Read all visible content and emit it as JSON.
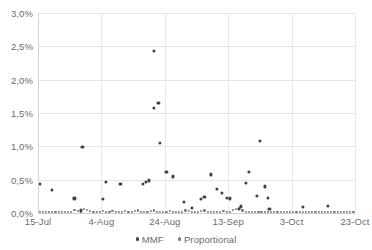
{
  "chart_data": {
    "type": "scatter",
    "title": "",
    "xlabel": "",
    "ylabel": "",
    "ylim": [
      0,
      3.0
    ],
    "ytick_labels": [
      "0,0%",
      "0,5%",
      "1,0%",
      "1,5%",
      "2,0%",
      "2,5%",
      "3,0%"
    ],
    "ytick_values": [
      0,
      0.5,
      1.0,
      1.5,
      2.0,
      2.5,
      3.0
    ],
    "xtick_labels": [
      "15-Jul",
      "4-Aug",
      "24-Aug",
      "13-Sep",
      "3-Oct",
      "23-Oct"
    ],
    "xtick_days": [
      0,
      20,
      40,
      60,
      80,
      100
    ],
    "xlim_days": [
      0,
      100
    ],
    "grid": "horizontal-and-vertical",
    "legend_position": "bottom-center",
    "unit": "percent",
    "decimal_separator": ",",
    "series": [
      {
        "name": "MMF",
        "color": "#404040",
        "marker": "circle",
        "points": [
          {
            "x": 0.5,
            "y": 0.44
          },
          {
            "x": 4.5,
            "y": 0.35
          },
          {
            "x": 11.5,
            "y": 0.22
          },
          {
            "x": 13.5,
            "y": 0.04
          },
          {
            "x": 14.0,
            "y": 0.99
          },
          {
            "x": 20.5,
            "y": 0.21
          },
          {
            "x": 21.5,
            "y": 0.47
          },
          {
            "x": 26.0,
            "y": 0.44
          },
          {
            "x": 33.0,
            "y": 0.44
          },
          {
            "x": 34.0,
            "y": 0.47
          },
          {
            "x": 35.0,
            "y": 0.49
          },
          {
            "x": 36.5,
            "y": 2.43
          },
          {
            "x": 36.5,
            "y": 1.58
          },
          {
            "x": 38.0,
            "y": 1.65
          },
          {
            "x": 38.5,
            "y": 1.05
          },
          {
            "x": 40.5,
            "y": 0.62
          },
          {
            "x": 42.5,
            "y": 0.55
          },
          {
            "x": 46.0,
            "y": 0.17
          },
          {
            "x": 48.5,
            "y": 0.08
          },
          {
            "x": 51.5,
            "y": 0.21
          },
          {
            "x": 52.5,
            "y": 0.24
          },
          {
            "x": 54.5,
            "y": 0.58
          },
          {
            "x": 56.5,
            "y": 0.36
          },
          {
            "x": 58.0,
            "y": 0.3
          },
          {
            "x": 59.5,
            "y": 0.23
          },
          {
            "x": 60.5,
            "y": 0.22
          },
          {
            "x": 63.5,
            "y": 0.06
          },
          {
            "x": 64.0,
            "y": 0.1
          },
          {
            "x": 65.5,
            "y": 0.45
          },
          {
            "x": 66.5,
            "y": 0.62
          },
          {
            "x": 69.0,
            "y": 0.26
          },
          {
            "x": 70.0,
            "y": 1.08
          },
          {
            "x": 71.5,
            "y": 0.4
          },
          {
            "x": 72.5,
            "y": 0.23
          },
          {
            "x": 73.0,
            "y": 0.06
          },
          {
            "x": 83.5,
            "y": 0.09
          },
          {
            "x": 91.5,
            "y": 0.11
          }
        ]
      },
      {
        "name": "Proportional",
        "color": "#7a7a7a",
        "marker": "circle",
        "points": [
          {
            "x": 0.5,
            "y": 0.015
          },
          {
            "x": 1.5,
            "y": 0.015
          },
          {
            "x": 2.5,
            "y": 0.02
          },
          {
            "x": 3.5,
            "y": 0.015
          },
          {
            "x": 4.5,
            "y": 0.02
          },
          {
            "x": 5.5,
            "y": 0.015
          },
          {
            "x": 6.5,
            "y": 0.02
          },
          {
            "x": 7.5,
            "y": 0.02
          },
          {
            "x": 8.5,
            "y": 0.015
          },
          {
            "x": 9.5,
            "y": 0.02
          },
          {
            "x": 10.5,
            "y": 0.02
          },
          {
            "x": 11.5,
            "y": 0.05
          },
          {
            "x": 12.5,
            "y": 0.03
          },
          {
            "x": 13.5,
            "y": 0.02
          },
          {
            "x": 14.5,
            "y": 0.06
          },
          {
            "x": 15.5,
            "y": 0.05
          },
          {
            "x": 16.5,
            "y": 0.03
          },
          {
            "x": 17.5,
            "y": 0.02
          },
          {
            "x": 18.5,
            "y": 0.02
          },
          {
            "x": 19.5,
            "y": 0.02
          },
          {
            "x": 20.5,
            "y": 0.03
          },
          {
            "x": 21.5,
            "y": 0.02
          },
          {
            "x": 22.5,
            "y": 0.02
          },
          {
            "x": 23.5,
            "y": 0.03
          },
          {
            "x": 24.5,
            "y": 0.02
          },
          {
            "x": 25.5,
            "y": 0.02
          },
          {
            "x": 26.5,
            "y": 0.02
          },
          {
            "x": 27.5,
            "y": 0.03
          },
          {
            "x": 28.5,
            "y": 0.02
          },
          {
            "x": 29.5,
            "y": 0.02
          },
          {
            "x": 30.5,
            "y": 0.03
          },
          {
            "x": 31.5,
            "y": 0.04
          },
          {
            "x": 32.5,
            "y": 0.02
          },
          {
            "x": 33.5,
            "y": 0.02
          },
          {
            "x": 34.5,
            "y": 0.02
          },
          {
            "x": 35.5,
            "y": 0.03
          },
          {
            "x": 36.5,
            "y": 0.04
          },
          {
            "x": 37.5,
            "y": 0.02
          },
          {
            "x": 38.5,
            "y": 0.02
          },
          {
            "x": 39.5,
            "y": 0.02
          },
          {
            "x": 40.5,
            "y": 0.02
          },
          {
            "x": 41.5,
            "y": 0.03
          },
          {
            "x": 42.5,
            "y": 0.02
          },
          {
            "x": 43.5,
            "y": 0.02
          },
          {
            "x": 44.5,
            "y": 0.02
          },
          {
            "x": 45.5,
            "y": 0.02
          },
          {
            "x": 46.5,
            "y": 0.04
          },
          {
            "x": 47.5,
            "y": 0.03
          },
          {
            "x": 48.5,
            "y": 0.02
          },
          {
            "x": 49.5,
            "y": 0.02
          },
          {
            "x": 50.5,
            "y": 0.02
          },
          {
            "x": 51.5,
            "y": 0.03
          },
          {
            "x": 52.5,
            "y": 0.04
          },
          {
            "x": 53.5,
            "y": 0.02
          },
          {
            "x": 54.5,
            "y": 0.02
          },
          {
            "x": 55.5,
            "y": 0.02
          },
          {
            "x": 56.5,
            "y": 0.02
          },
          {
            "x": 57.5,
            "y": 0.02
          },
          {
            "x": 58.5,
            "y": 0.03
          },
          {
            "x": 59.5,
            "y": 0.02
          },
          {
            "x": 60.5,
            "y": 0.02
          },
          {
            "x": 61.5,
            "y": 0.05
          },
          {
            "x": 62.5,
            "y": 0.06
          },
          {
            "x": 63.5,
            "y": 0.08
          },
          {
            "x": 64.5,
            "y": 0.04
          },
          {
            "x": 65.5,
            "y": 0.02
          },
          {
            "x": 66.5,
            "y": 0.02
          },
          {
            "x": 67.5,
            "y": 0.02
          },
          {
            "x": 68.5,
            "y": 0.02
          },
          {
            "x": 69.5,
            "y": 0.02
          },
          {
            "x": 70.5,
            "y": 0.02
          },
          {
            "x": 71.5,
            "y": 0.02
          },
          {
            "x": 72.5,
            "y": 0.02
          },
          {
            "x": 73.5,
            "y": 0.02
          },
          {
            "x": 74.5,
            "y": 0.02
          },
          {
            "x": 75.5,
            "y": 0.02
          },
          {
            "x": 76.5,
            "y": 0.02
          },
          {
            "x": 77.5,
            "y": 0.02
          },
          {
            "x": 78.5,
            "y": 0.02
          },
          {
            "x": 79.5,
            "y": 0.02
          },
          {
            "x": 80.5,
            "y": 0.02
          },
          {
            "x": 81.5,
            "y": 0.02
          },
          {
            "x": 82.5,
            "y": 0.02
          },
          {
            "x": 83.5,
            "y": 0.02
          },
          {
            "x": 84.5,
            "y": 0.02
          },
          {
            "x": 85.5,
            "y": 0.02
          },
          {
            "x": 86.5,
            "y": 0.02
          },
          {
            "x": 87.5,
            "y": 0.02
          },
          {
            "x": 88.5,
            "y": 0.02
          },
          {
            "x": 89.5,
            "y": 0.02
          },
          {
            "x": 90.5,
            "y": 0.02
          },
          {
            "x": 91.5,
            "y": 0.02
          },
          {
            "x": 92.5,
            "y": 0.02
          },
          {
            "x": 93.5,
            "y": 0.02
          },
          {
            "x": 94.5,
            "y": 0.02
          },
          {
            "x": 95.5,
            "y": 0.02
          },
          {
            "x": 96.5,
            "y": 0.02
          },
          {
            "x": 97.5,
            "y": 0.02
          },
          {
            "x": 98.5,
            "y": 0.02
          },
          {
            "x": 99.5,
            "y": 0.02
          }
        ]
      }
    ]
  },
  "legend": {
    "items": [
      {
        "label": "MMF"
      },
      {
        "label": "Proportional"
      }
    ]
  },
  "colors": {
    "mmf": "#404040",
    "proportional": "#7a7a7a",
    "gridline": "#e4e4e4",
    "axis_text": "#6b6b6b",
    "background": "#ffffff"
  }
}
